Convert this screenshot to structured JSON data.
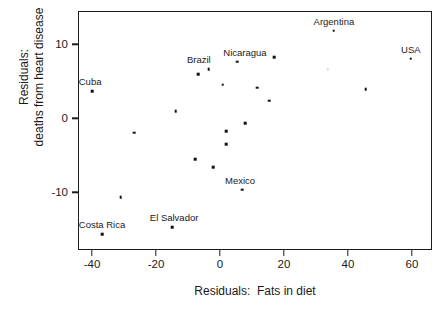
{
  "chart_data": {
    "type": "scatter",
    "title": "",
    "xlabel": "Residuals:  Fats in diet",
    "ylabel_lines": [
      "Residuals:",
      "deaths from heart disease"
    ],
    "xlim": [
      -44.4,
      66.3
    ],
    "ylim": [
      -17.8,
      14.5
    ],
    "xticks": [
      -40,
      -20,
      0,
      20,
      40,
      60
    ],
    "xtick_labels": [
      "-40",
      "-20",
      "0",
      "20",
      "40",
      "60"
    ],
    "yticks": [
      10,
      0,
      -10
    ],
    "ytick_labels": [
      "10",
      "0",
      "-10"
    ],
    "grid": false,
    "legend": "none",
    "marker": "small-filled-square",
    "marker_color": "#111111",
    "points": [
      {
        "x": -40.3,
        "y": 3.8,
        "label": "Cuba",
        "label_dx": -2,
        "label_dy": -4
      },
      {
        "x": -27.2,
        "y": -1.8,
        "label": "",
        "label_dx": 0,
        "label_dy": 0
      },
      {
        "x": -31.3,
        "y": -10.5,
        "label": "",
        "label_dx": 0,
        "label_dy": 0
      },
      {
        "x": -37.2,
        "y": -15.5,
        "label": "Costa Rica",
        "label_dx": 0,
        "label_dy": -4
      },
      {
        "x": -15.3,
        "y": -14.6,
        "label": "El Salvador",
        "label_dx": 2,
        "label_dy": -4
      },
      {
        "x": -14.1,
        "y": 1.1,
        "label": "",
        "label_dx": 0,
        "label_dy": 0
      },
      {
        "x": -7.2,
        "y": 6.1,
        "label": "",
        "label_dx": 0,
        "label_dy": 0
      },
      {
        "x": -3.8,
        "y": 6.8,
        "label": "Brazil",
        "label_dx": -10,
        "label_dy": -4
      },
      {
        "x": 0.6,
        "y": 4.7,
        "label": "",
        "label_dx": 0,
        "label_dy": 0
      },
      {
        "x": -8.0,
        "y": -5.4,
        "label": "",
        "label_dx": 0,
        "label_dy": 0
      },
      {
        "x": -2.5,
        "y": -6.5,
        "label": "",
        "label_dx": 0,
        "label_dy": 0
      },
      {
        "x": 1.6,
        "y": -1.6,
        "label": "",
        "label_dx": 0,
        "label_dy": 0
      },
      {
        "x": 1.6,
        "y": -3.4,
        "label": "",
        "label_dx": 0,
        "label_dy": 0
      },
      {
        "x": 7.5,
        "y": -0.5,
        "label": "",
        "label_dx": 0,
        "label_dy": 0
      },
      {
        "x": 5.0,
        "y": 7.8,
        "label": "Nicaragua",
        "label_dx": 8,
        "label_dy": -4
      },
      {
        "x": 6.6,
        "y": -9.5,
        "label": "Mexico",
        "label_dx": -2,
        "label_dy": -4
      },
      {
        "x": 11.3,
        "y": 4.3,
        "label": "",
        "label_dx": 0,
        "label_dy": 0
      },
      {
        "x": 15.0,
        "y": 2.5,
        "label": "",
        "label_dx": 0,
        "label_dy": 0
      },
      {
        "x": 16.6,
        "y": 8.4,
        "label": "",
        "label_dx": 0,
        "label_dy": 0
      },
      {
        "x": 33.4,
        "y": 6.8,
        "label": "",
        "label_dx": 0,
        "label_dy": 0,
        "faint": true
      },
      {
        "x": 35.3,
        "y": 12.0,
        "label": "Argentina",
        "label_dx": 0,
        "label_dy": -4
      },
      {
        "x": 45.3,
        "y": 4.1,
        "label": "",
        "label_dx": 0,
        "label_dy": 0
      },
      {
        "x": 59.4,
        "y": 8.2,
        "label": "USA",
        "label_dx": 0,
        "label_dy": -4
      }
    ]
  }
}
